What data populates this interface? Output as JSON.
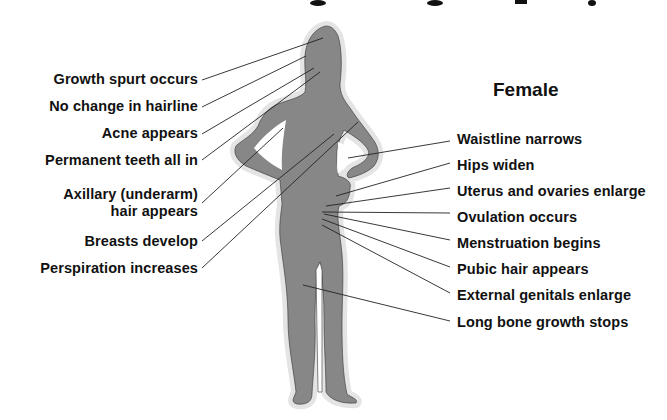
{
  "figure": {
    "sex_label": "Female",
    "colors": {
      "silhouette": "#878787",
      "halo": "#e4e4e4",
      "leader_line": "#222222",
      "text": "#111111"
    }
  },
  "left_labels": [
    {
      "text": "Growth spurt occurs"
    },
    {
      "text": "No change in hairline"
    },
    {
      "text": "Acne appears"
    },
    {
      "text": "Permanent teeth all in"
    },
    {
      "text": "Axillary (underarm)",
      "text2": "hair appears"
    },
    {
      "text": "Breasts develop"
    },
    {
      "text": "Perspiration increases"
    }
  ],
  "right_labels": [
    {
      "text": "Waistline narrows"
    },
    {
      "text": "Hips widen"
    },
    {
      "text": "Uterus and ovaries enlarge"
    },
    {
      "text": "Ovulation occurs"
    },
    {
      "text": "Menstruation begins"
    },
    {
      "text": "Pubic hair appears"
    },
    {
      "text": "External genitals enlarge"
    },
    {
      "text": "Long bone growth stops"
    }
  ]
}
